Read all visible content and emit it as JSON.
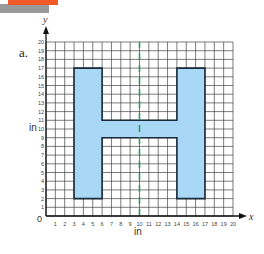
{
  "figure": {
    "part_label": "a.",
    "x_axis_symbol": "x",
    "y_axis_symbol": "y",
    "x_unit": "in",
    "y_unit": "in",
    "origin_label": "0",
    "x_ticks": [
      "1",
      "2",
      "3",
      "4",
      "5",
      "6",
      "7",
      "8",
      "9",
      "10",
      "11",
      "12",
      "13",
      "14",
      "15",
      "16",
      "17",
      "18",
      "19",
      "20"
    ],
    "y_ticks": [
      "1",
      "2",
      "3",
      "4",
      "5",
      "6",
      "7",
      "8",
      "9",
      "10",
      "11",
      "12",
      "13",
      "14",
      "15",
      "16",
      "17",
      "18",
      "19",
      "20"
    ],
    "colors": {
      "banner": "#f05a28",
      "banner_shadow": "#9a9a9a",
      "shape_fill": "#a8d8f5",
      "shape_stroke": "#1a2a3a",
      "symmetry_line": "#2e9a5a",
      "grid": "#444444"
    }
  },
  "chart_data": {
    "type": "diagram",
    "title": "",
    "xlabel": "in",
    "ylabel": "in",
    "xlim": [
      0,
      20
    ],
    "ylim": [
      0,
      20
    ],
    "grid": true,
    "shape": {
      "name": "H-shaped polygon",
      "vertices": [
        [
          3,
          2
        ],
        [
          6,
          2
        ],
        [
          6,
          9
        ],
        [
          14,
          9
        ],
        [
          14,
          2
        ],
        [
          17,
          2
        ],
        [
          17,
          17
        ],
        [
          14,
          17
        ],
        [
          14,
          11
        ],
        [
          6,
          11
        ],
        [
          6,
          17
        ],
        [
          3,
          17
        ]
      ]
    },
    "line_of_symmetry": {
      "x": 10,
      "style": "dashed",
      "color": "#2e9a5a"
    }
  }
}
